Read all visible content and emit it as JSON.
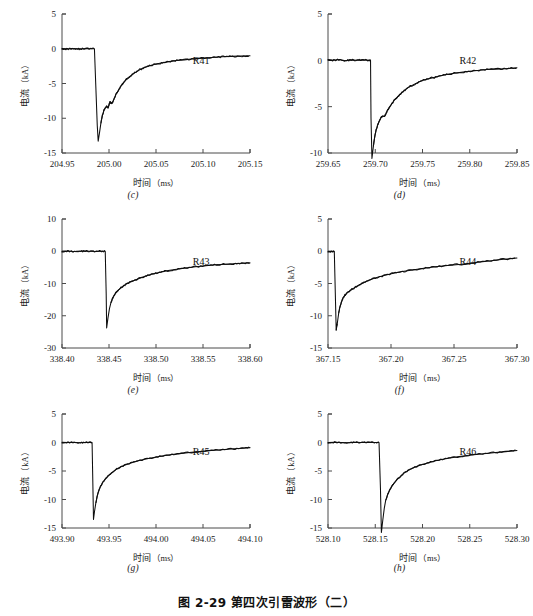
{
  "figure": {
    "caption": "图 2-29  第四次引雷波形（二）",
    "y_axis_label_cn": "电流",
    "y_axis_unit": "（kA）",
    "x_axis_label_cn": "时间",
    "x_axis_unit": "（ms）",
    "line_color": "#0d0d0d",
    "axis_color": "#4a4a4a",
    "background_color": "#ffffff"
  },
  "chart_data": [
    {
      "type": "line",
      "panel": "(c)",
      "series_label": "R41",
      "title": "",
      "xlabel": "时间（ms）",
      "ylabel": "电流（kA）",
      "xlim": [
        204.95,
        205.15
      ],
      "ylim": [
        -15,
        5
      ],
      "xticks": [
        204.95,
        205.0,
        205.05,
        205.1,
        205.15
      ],
      "xtick_labels": [
        "204.95",
        "205.00",
        "205.05",
        "205.10",
        "205.15"
      ],
      "yticks": [
        5,
        0,
        -5,
        -10,
        -15
      ],
      "ytick_labels": [
        "5",
        "0",
        "-5",
        "-10",
        "-15"
      ],
      "grid": false,
      "peak_time": 204.9885,
      "peak_current": -13.3,
      "x": [
        204.95,
        204.955,
        204.96,
        204.965,
        204.97,
        204.975,
        204.98,
        204.9845,
        204.986,
        204.9875,
        204.9885,
        204.99,
        204.9915,
        204.993,
        204.9945,
        204.996,
        204.9975,
        204.999,
        205.0,
        205.001,
        205.0025,
        205.004,
        205.006,
        205.008,
        205.01,
        205.013,
        205.016,
        205.02,
        205.024,
        205.028,
        205.033,
        205.038,
        205.044,
        205.05,
        205.057,
        205.064,
        205.072,
        205.08,
        205.09,
        205.1,
        205.11,
        205.12,
        205.13,
        205.14,
        205.15
      ],
      "y": [
        0.05,
        -0.05,
        0.05,
        0.0,
        -0.05,
        0.05,
        0.0,
        0.0,
        -5.5,
        -11.0,
        -13.3,
        -12.0,
        -10.6,
        -9.6,
        -8.9,
        -8.5,
        -8.3,
        -8.5,
        -8.1,
        -7.6,
        -7.9,
        -7.7,
        -7.0,
        -6.4,
        -6.0,
        -5.3,
        -4.8,
        -4.2,
        -3.8,
        -3.4,
        -3.0,
        -2.7,
        -2.4,
        -2.2,
        -2.0,
        -1.85,
        -1.7,
        -1.6,
        -1.45,
        -1.35,
        -1.25,
        -1.15,
        -1.1,
        -1.05,
        -1.0
      ]
    },
    {
      "type": "line",
      "panel": "(d)",
      "series_label": "R42",
      "title": "",
      "xlabel": "时间（ms）",
      "ylabel": "电流（kA）",
      "xlim": [
        259.65,
        259.85
      ],
      "ylim": [
        -10,
        5
      ],
      "xticks": [
        259.65,
        259.7,
        259.75,
        259.8,
        259.85
      ],
      "xtick_labels": [
        "259.65",
        "259.70",
        "259.75",
        "259.80",
        "259.85"
      ],
      "yticks": [
        5,
        0,
        -5,
        -10
      ],
      "ytick_labels": [
        "5",
        "0",
        "-5",
        "-10"
      ],
      "grid": false,
      "peak_time": 259.6965,
      "peak_current": -10.6,
      "x": [
        259.65,
        259.656,
        259.662,
        259.668,
        259.674,
        259.68,
        259.686,
        259.692,
        259.695,
        259.6955,
        259.6965,
        259.698,
        259.6995,
        259.701,
        259.7025,
        259.704,
        259.706,
        259.708,
        259.71,
        259.7115,
        259.713,
        259.715,
        259.718,
        259.721,
        259.725,
        259.729,
        259.734,
        259.739,
        259.745,
        259.752,
        259.76,
        259.768,
        259.777,
        259.787,
        259.797,
        259.808,
        259.818,
        259.828,
        259.838,
        259.845,
        259.85
      ],
      "y": [
        0.1,
        0.0,
        0.1,
        -0.05,
        0.05,
        0.0,
        0.05,
        0.0,
        0.0,
        -6.2,
        -10.6,
        -9.3,
        -8.2,
        -7.5,
        -7.0,
        -6.6,
        -6.2,
        -6.0,
        -6.05,
        -5.7,
        -5.4,
        -5.1,
        -4.6,
        -4.2,
        -3.8,
        -3.4,
        -3.0,
        -2.7,
        -2.4,
        -2.1,
        -1.9,
        -1.7,
        -1.5,
        -1.35,
        -1.2,
        -1.1,
        -1.0,
        -0.95,
        -0.9,
        -0.85,
        -0.8
      ]
    },
    {
      "type": "line",
      "panel": "(e)",
      "series_label": "R43",
      "title": "",
      "xlabel": "时间（ms）",
      "ylabel": "电流（kA）",
      "xlim": [
        338.4,
        338.6
      ],
      "ylim": [
        -30,
        10
      ],
      "xticks": [
        338.4,
        338.45,
        338.5,
        338.55,
        338.6
      ],
      "xtick_labels": [
        "338.40",
        "338.45",
        "338.50",
        "338.55",
        "338.60"
      ],
      "yticks": [
        10,
        0,
        -10,
        -20,
        -30
      ],
      "ytick_labels": [
        "10",
        "0",
        "-10",
        "-20",
        "-30"
      ],
      "grid": false,
      "peak_time": 338.4475,
      "peak_current": -23.8,
      "x": [
        338.4,
        338.406,
        338.412,
        338.418,
        338.424,
        338.43,
        338.436,
        338.442,
        338.446,
        338.447,
        338.4475,
        338.449,
        338.4505,
        338.452,
        338.4535,
        338.455,
        338.457,
        338.459,
        338.462,
        338.465,
        338.469,
        338.473,
        338.478,
        338.484,
        338.49,
        338.497,
        338.505,
        338.513,
        338.522,
        338.532,
        338.542,
        338.553,
        338.564,
        338.575,
        338.586,
        338.594,
        338.6
      ],
      "y": [
        0.0,
        0.05,
        -0.05,
        0.0,
        0.05,
        0.0,
        -0.05,
        0.0,
        0.0,
        -13.0,
        -23.8,
        -20.5,
        -17.8,
        -16.0,
        -14.8,
        -13.9,
        -13.0,
        -12.3,
        -11.5,
        -10.8,
        -10.1,
        -9.5,
        -8.9,
        -8.2,
        -7.6,
        -7.0,
        -6.5,
        -6.0,
        -5.6,
        -5.2,
        -4.8,
        -4.5,
        -4.2,
        -4.0,
        -3.8,
        -3.7,
        -3.6
      ]
    },
    {
      "type": "line",
      "panel": "(f)",
      "series_label": "R44",
      "title": "",
      "xlabel": "时间（ms）",
      "ylabel": "电流（kA）",
      "xlim": [
        367.15,
        367.3
      ],
      "ylim": [
        -15,
        5
      ],
      "xticks": [
        367.15,
        367.2,
        367.25,
        367.3
      ],
      "xtick_labels": [
        "367.15",
        "367.20",
        "367.25",
        "367.30"
      ],
      "yticks": [
        5,
        0,
        -5,
        -10,
        -15
      ],
      "ytick_labels": [
        "5",
        "0",
        "-5",
        "-10",
        "-15"
      ],
      "grid": false,
      "peak_time": 367.1565,
      "peak_current": -12.2,
      "x": [
        367.15,
        367.1525,
        367.155,
        367.1558,
        367.1565,
        367.1575,
        367.1585,
        367.1595,
        367.1608,
        367.162,
        367.1635,
        367.165,
        367.167,
        367.169,
        367.1715,
        367.174,
        367.177,
        367.181,
        367.185,
        367.19,
        367.196,
        367.202,
        367.209,
        367.217,
        367.226,
        367.235,
        367.245,
        367.256,
        367.267,
        367.278,
        367.289,
        367.3
      ],
      "y": [
        0.0,
        -0.05,
        0.0,
        -6.5,
        -12.2,
        -11.0,
        -9.6,
        -8.6,
        -7.8,
        -7.2,
        -6.8,
        -6.5,
        -6.2,
        -5.9,
        -5.6,
        -5.3,
        -5.0,
        -4.6,
        -4.3,
        -4.0,
        -3.7,
        -3.4,
        -3.15,
        -2.9,
        -2.65,
        -2.4,
        -2.2,
        -2.0,
        -1.75,
        -1.5,
        -1.25,
        -1.05
      ]
    },
    {
      "type": "line",
      "panel": "(g)",
      "series_label": "R45",
      "title": "",
      "xlabel": "时间（ms）",
      "ylabel": "电流（kA）",
      "xlim": [
        493.9,
        494.1
      ],
      "ylim": [
        -15,
        5
      ],
      "xticks": [
        493.9,
        493.95,
        494.0,
        494.05,
        494.1
      ],
      "xtick_labels": [
        "493.90",
        "493.95",
        "494.00",
        "494.05",
        "494.10"
      ],
      "yticks": [
        5,
        0,
        -5,
        -10,
        -15
      ],
      "ytick_labels": [
        "5",
        "0",
        "-5",
        "-10",
        "-15"
      ],
      "grid": false,
      "peak_time": 493.9335,
      "peak_current": -13.5,
      "x": [
        493.9,
        493.906,
        493.912,
        493.918,
        493.924,
        493.929,
        493.932,
        493.9328,
        493.9335,
        493.9345,
        493.936,
        493.9375,
        493.939,
        493.941,
        493.943,
        493.946,
        493.949,
        493.953,
        493.957,
        493.962,
        493.968,
        493.975,
        493.983,
        493.992,
        494.002,
        494.013,
        494.025,
        494.038,
        494.052,
        494.066,
        494.08,
        494.092,
        494.1
      ],
      "y": [
        0.05,
        0.0,
        0.05,
        -0.05,
        0.0,
        0.05,
        0.0,
        -7.0,
        -13.5,
        -12.2,
        -10.6,
        -9.4,
        -8.5,
        -7.7,
        -7.1,
        -6.4,
        -5.9,
        -5.3,
        -4.8,
        -4.3,
        -3.9,
        -3.5,
        -3.1,
        -2.8,
        -2.5,
        -2.2,
        -1.95,
        -1.7,
        -1.5,
        -1.3,
        -1.15,
        -1.0,
        -0.9
      ]
    },
    {
      "type": "line",
      "panel": "(h)",
      "series_label": "R46",
      "title": "",
      "xlabel": "时间（ms）",
      "ylabel": "电流（kA）",
      "xlim": [
        528.1,
        528.3
      ],
      "ylim": [
        -15,
        5
      ],
      "xticks": [
        528.1,
        528.15,
        528.2,
        528.25,
        528.3
      ],
      "xtick_labels": [
        "528.10",
        "528.15",
        "528.20",
        "528.25",
        "528.30"
      ],
      "yticks": [
        5,
        0,
        -5,
        -10,
        -15
      ],
      "ytick_labels": [
        "5",
        "0",
        "-5",
        "-10",
        "-15"
      ],
      "grid": false,
      "peak_time": 528.1565,
      "peak_current": -15.8,
      "x": [
        528.1,
        528.107,
        528.114,
        528.121,
        528.128,
        528.135,
        528.142,
        528.149,
        528.154,
        528.1555,
        528.1565,
        528.158,
        528.1595,
        528.161,
        528.163,
        528.165,
        528.1675,
        528.17,
        528.173,
        528.177,
        528.181,
        528.186,
        528.192,
        528.199,
        528.207,
        528.216,
        528.226,
        528.237,
        528.249,
        528.262,
        528.275,
        528.288,
        528.3
      ],
      "y": [
        0.0,
        0.05,
        0.0,
        -0.05,
        0.05,
        0.0,
        0.05,
        0.0,
        0.0,
        -8.0,
        -15.8,
        -13.6,
        -11.6,
        -10.2,
        -9.2,
        -8.4,
        -7.7,
        -7.1,
        -6.5,
        -5.9,
        -5.3,
        -4.8,
        -4.3,
        -3.9,
        -3.5,
        -3.1,
        -2.8,
        -2.5,
        -2.25,
        -2.0,
        -1.8,
        -1.6,
        -1.4
      ]
    }
  ]
}
